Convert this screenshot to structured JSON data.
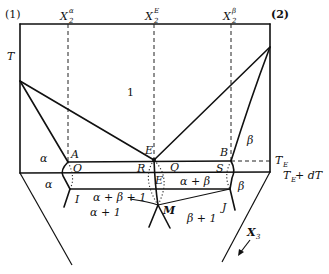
{
  "figure": {
    "type": "ternary eutectic phase diagram, vertical section / projection",
    "colors": {
      "line": "#111111",
      "background": "#ffffff"
    },
    "axis": {
      "component_left": "(1)",
      "component_right": "(2)",
      "temperature_label": "T",
      "composition_markers": [
        {
          "base": "X",
          "sub": "2",
          "sup": "α"
        },
        {
          "base": "X",
          "sub": "2",
          "sup": "E"
        },
        {
          "base": "X",
          "sub": "2",
          "sup": "β"
        }
      ],
      "third_axis_label": {
        "base": "X",
        "sub": "3"
      }
    },
    "temperature_levels": [
      {
        "base": "T",
        "sub": "E",
        "suffix": ""
      },
      {
        "base": "T",
        "sub": "E",
        "suffix": " + dT"
      }
    ],
    "regions": {
      "liquid": "1",
      "alpha_upper": "α",
      "beta_upper": "β",
      "alpha_lower": "α",
      "beta_lower": "β",
      "alpha_beta": "α + β",
      "alpha_beta_liquid": "α + β + 1",
      "alpha_liquid": "α + 1",
      "beta_liquid": "β + 1"
    },
    "points": {
      "A": "A",
      "E_upper": "E",
      "B": "B",
      "O": "O",
      "R": "R",
      "Q": "Q",
      "E_lower": "E",
      "S": "S",
      "I": "I",
      "J": "J",
      "M": "M"
    }
  }
}
